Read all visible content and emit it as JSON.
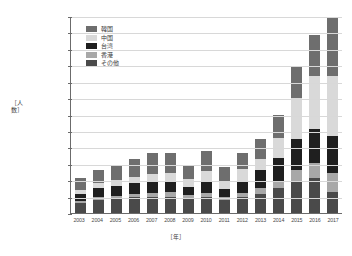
{
  "chart": {
    "type": "bar",
    "ytitle": "［人数］",
    "xtitle": "［年］"
  },
  "chart_data": {
    "type": "bar",
    "stacked": true,
    "title": "",
    "subtitle": "",
    "xlabel": "［年］",
    "ylabel": "［人数］",
    "ylim": [
      0,
      24000000
    ],
    "ytick_step": 2000000,
    "ytick_labels": [
      "0",
      "2,000,000",
      "4,000,000",
      "6,000,000",
      "8,000,000",
      "10,000,000",
      "12,000,000",
      "14,000,000",
      "16,000,000",
      "18,000,000",
      "20,000,000",
      "22,000,000",
      "24,000,000"
    ],
    "grid": true,
    "legend_position": "top-left-inside",
    "categories": [
      "2003",
      "2004",
      "2005",
      "2006",
      "2007",
      "2008",
      "2009",
      "2010",
      "2011",
      "2012",
      "2013",
      "2014",
      "2015",
      "2016",
      "2017"
    ],
    "stack_order_bottom_to_top": [
      "その他",
      "香港",
      "台湾",
      "中国",
      "韓国"
    ],
    "series": [
      {
        "name": "韓国",
        "color": "#6e6e6e",
        "values": [
          1459000,
          1588000,
          1747000,
          2117000,
          2601000,
          2382000,
          1587000,
          2440000,
          1658000,
          2042000,
          2456000,
          2755000,
          4002000,
          5090000,
          7140000
        ]
      },
      {
        "name": "中国",
        "color": "#d9d9d9",
        "values": [
          448000,
          616000,
          653000,
          812000,
          942000,
          1000000,
          1006000,
          1413000,
          1043000,
          1425000,
          1314000,
          2409000,
          4994000,
          6373000,
          7356000
        ]
      },
      {
        "name": "台湾",
        "color": "#1f1f1f",
        "values": [
          785000,
          1081000,
          1275000,
          1309000,
          1385000,
          1390000,
          1024000,
          1268000,
          994000,
          1467000,
          2211000,
          2830000,
          3677000,
          4167000,
          4564000
        ]
      },
      {
        "name": "香港",
        "color": "#a8a8a8",
        "values": [
          260000,
          300000,
          299000,
          352000,
          432000,
          550000,
          450000,
          508000,
          365000,
          482000,
          746000,
          926000,
          1524000,
          1839000,
          2232000
        ]
      },
      {
        "name": "その他",
        "color": "#4a4a4a",
        "values": [
          1260000,
          1626000,
          1753000,
          1943000,
          2002000,
          1997000,
          1723000,
          1982000,
          1560000,
          1952000,
          2310000,
          3000000,
          3777000,
          4271000,
          2599000
        ]
      }
    ],
    "totals": [
      4212000,
      5211000,
      5727000,
      6533000,
      7362000,
      7319000,
      5790000,
      7611000,
      5620000,
      7368000,
      9037000,
      11920000,
      17974000,
      21740000,
      23891000
    ]
  },
  "legend": {
    "items": [
      {
        "label": "韓国",
        "color": "#6e6e6e"
      },
      {
        "label": "中国",
        "color": "#d9d9d9"
      },
      {
        "label": "台湾",
        "color": "#1f1f1f"
      },
      {
        "label": "香港",
        "color": "#a8a8a8"
      },
      {
        "label": "その他",
        "color": "#4a4a4a"
      }
    ]
  }
}
